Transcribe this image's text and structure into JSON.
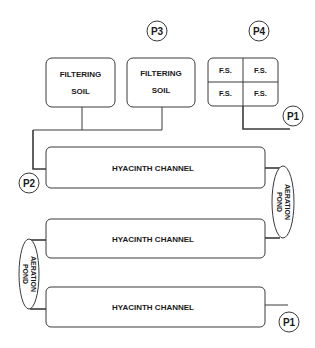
{
  "diagram": {
    "type": "process-flow",
    "points": {
      "p1_top": "P1",
      "p1_bottom": "P1",
      "p2": "P2",
      "p3": "P3",
      "p4": "P4"
    },
    "filtering_soil": [
      {
        "line1": "FILTERING",
        "line2": "SOIL"
      },
      {
        "line1": "FILTERING",
        "line2": "SOIL"
      }
    ],
    "fs_grid": [
      "F.S.",
      "F.S.",
      "F.S.",
      "F.S."
    ],
    "channels": [
      {
        "label": "HYACINTH CHANNEL"
      },
      {
        "label": "HYACINTH CHANNEL"
      },
      {
        "label": "HYACINTH CHANNEL"
      }
    ],
    "aeration_ponds": [
      {
        "line1": "AERATION",
        "line2": "POND",
        "side": "right"
      },
      {
        "line1": "AERATION",
        "line2": "POND",
        "side": "left"
      }
    ],
    "colors": {
      "stroke": "#3a3a3a",
      "text": "#1a1a1a",
      "background": "#ffffff"
    }
  }
}
